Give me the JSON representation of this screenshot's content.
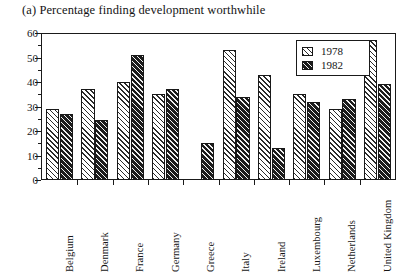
{
  "chart_data": {
    "type": "bar",
    "title": "(a) Percentage finding development worthwhile",
    "xlabel": "",
    "ylabel": "",
    "ylim": [
      0,
      60
    ],
    "ytick_step": 10,
    "yticks": [
      0,
      10,
      20,
      30,
      40,
      50,
      60
    ],
    "ytick_labels": [
      "0",
      "10",
      "20",
      "30",
      "40",
      "50",
      "60"
    ],
    "minor_ytick_step": 5,
    "grid": false,
    "legend_position": "top-right",
    "categories": [
      "Belgium",
      "Denmark",
      "France",
      "Germany",
      "Greece",
      "Italy",
      "Ireland",
      "Luxembourg",
      "Netherlands",
      "United Kingdom"
    ],
    "series": [
      {
        "name": "1978",
        "values": [
          29,
          37,
          40,
          35,
          null,
          53,
          43,
          35,
          29,
          57
        ]
      },
      {
        "name": "1982",
        "values": [
          27,
          24.5,
          51,
          37,
          15,
          34,
          13,
          32,
          33,
          39
        ]
      }
    ]
  },
  "legend": {
    "entries": [
      {
        "label": "1978",
        "pattern": "light-diagonal-hatch"
      },
      {
        "label": "1982",
        "pattern": "dark-diagonal-hatch"
      }
    ]
  },
  "colors": {
    "axis": "#1a1a1a",
    "text": "#141414",
    "background": "#ffffff",
    "series_1978_fill": "#ffffff",
    "series_1978_hatch": "#2a2a2a",
    "series_1982_fill": "#3b3b3b",
    "series_1982_hatch": "#f2f2f2"
  }
}
